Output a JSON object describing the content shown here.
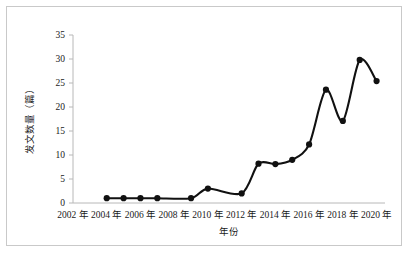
{
  "chart_data": {
    "type": "line",
    "title": "",
    "xlabel": "年份",
    "ylabel": "发文数量（篇）",
    "xlim": [
      2002,
      2020.5
    ],
    "ylim": [
      0,
      35
    ],
    "yticks": [
      0,
      5,
      10,
      15,
      20,
      25,
      30,
      35
    ],
    "ytick_labels": [
      "0",
      "5",
      "10",
      "15",
      "20",
      "25",
      "30",
      "35"
    ],
    "xticks": [
      2002,
      2004,
      2006,
      2008,
      2010,
      2012,
      2014,
      2016,
      2018,
      2020
    ],
    "xtick_labels": [
      "2002 年",
      "2004 年",
      "2006 年",
      "2008 年",
      "2010 年",
      "2012 年",
      "2014 年",
      "2016 年",
      "2018 年",
      "2020 年"
    ],
    "grid": false,
    "legend": false,
    "marker": "circle-filled",
    "line_color": "#111111",
    "marker_color": "#111111",
    "axis_color": "#b8b8b8",
    "series": [
      {
        "name": "发文数量",
        "x": [
          2004,
          2005,
          2006,
          2007,
          2009,
          2010,
          2012,
          2013,
          2014,
          2015,
          2016,
          2017,
          2018,
          2019,
          2020
        ],
        "values": [
          1,
          1,
          1,
          1,
          1,
          3,
          2,
          8.2,
          8.1,
          9,
          12.2,
          23.6,
          17.1,
          29.8,
          25.4
        ]
      }
    ]
  },
  "figure": {
    "border_color": "#c9c9c9",
    "background": "#ffffff"
  }
}
